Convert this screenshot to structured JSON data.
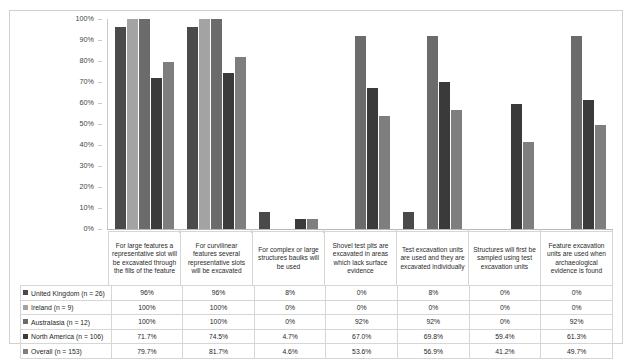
{
  "chart_data": {
    "type": "bar",
    "title": "",
    "xlabel": "",
    "ylabel": "",
    "ylim": [
      0,
      100
    ],
    "grid": false,
    "legend_position": "table-row-headers",
    "ytick_labels": [
      "100%",
      "90%",
      "80%",
      "70%",
      "60%",
      "50%",
      "40%",
      "30%",
      "20%",
      "10%",
      "0%"
    ],
    "ytick_values": [
      100,
      90,
      80,
      70,
      60,
      50,
      40,
      30,
      20,
      10,
      0
    ],
    "categories": [
      "For large features a representative slot will be excavated through the fills of the feature",
      "For curvilinear features several representative slots will be excavated",
      "For complex or large structures baulks will be used",
      "Shovel test pits are excavated in areas which lack surface evidence",
      "Test excavation units are used and they are excavated individually",
      "Structures will first be sampled using test excavation units",
      "Feature excavation units are used when archaeological evidence is found"
    ],
    "series": [
      {
        "name": "United Kingdom (n = 26)",
        "color": "#4a4a4a",
        "values": [
          96,
          96,
          8,
          0,
          8,
          0,
          0
        ],
        "labels": [
          "96%",
          "96%",
          "8%",
          "0%",
          "8%",
          "0%",
          "0%"
        ]
      },
      {
        "name": "Ireland (n = 9)",
        "color": "#a3a3a3",
        "values": [
          100,
          100,
          0,
          0,
          0,
          0,
          0
        ],
        "labels": [
          "100%",
          "100%",
          "0%",
          "0%",
          "0%",
          "0%",
          "0%"
        ]
      },
      {
        "name": "Australasia (n = 12)",
        "color": "#6b6b6b",
        "values": [
          100,
          100,
          0,
          92,
          92,
          0,
          92
        ],
        "labels": [
          "100%",
          "100%",
          "0%",
          "92%",
          "92%",
          "0%",
          "92%"
        ]
      },
      {
        "name": "North America (n = 106)",
        "color": "#3a3a3a",
        "values": [
          71.7,
          74.5,
          4.7,
          67.0,
          69.8,
          59.4,
          61.3
        ],
        "labels": [
          "71.7%",
          "74.5%",
          "4.7%",
          "67.0%",
          "69.8%",
          "59.4%",
          "61.3%"
        ]
      },
      {
        "name": "Overall (n = 153)",
        "color": "#7e7e7e",
        "values": [
          79.7,
          81.7,
          4.6,
          53.6,
          56.9,
          41.2,
          49.7
        ],
        "labels": [
          "79.7%",
          "81.7%",
          "4.6%",
          "53.6%",
          "56.9%",
          "41.2%",
          "49.7%"
        ]
      }
    ]
  }
}
